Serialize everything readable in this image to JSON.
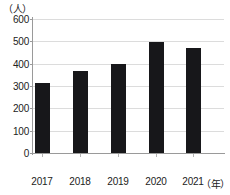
{
  "chart_data": {
    "type": "bar",
    "title": "",
    "subtitle": "",
    "categories": [
      "2017",
      "2018",
      "2019",
      "2020",
      "2021"
    ],
    "values": [
      315,
      368,
      397,
      497,
      470
    ],
    "xlabel": "（年）",
    "ylabel": "（人）",
    "ylim": [
      0,
      600
    ],
    "ytick_labels": [
      "0",
      "100",
      "200",
      "300",
      "400",
      "500",
      "600"
    ],
    "ytick_values": [
      0,
      100,
      200,
      300,
      400,
      500,
      600
    ],
    "grid": true,
    "legend": "none",
    "bar_color": "#17171a",
    "grid_color": "#dcdcdc",
    "axis_color": "#9a9a9a",
    "text_color": "#222222",
    "annotations": []
  }
}
